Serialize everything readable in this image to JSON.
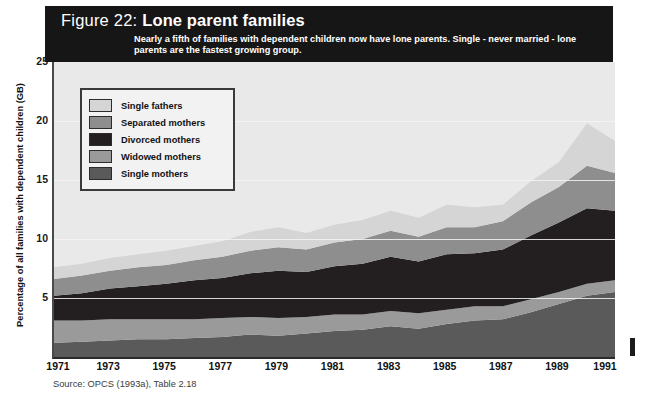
{
  "figure": {
    "number": "Figure 22:",
    "name": "Lone parent families",
    "subtitle": "Nearly a fifth of families with dependent children now have lone parents. Single - never married - lone parents are the fastest growing group.",
    "source": "Source: OPCS (1993a), Table 2.18"
  },
  "colors": {
    "header_band": "#161616",
    "plot_background": "#e9e9e9",
    "single_fathers": "#d5d5d5",
    "separated_mothers": "#8e8e8e",
    "divorced_mothers": "#231f20",
    "widowed_mothers": "#9a9a9a",
    "single_mothers": "#5a5a5a"
  },
  "legend": {
    "items": [
      {
        "label": "Single fathers",
        "color": "#d5d5d5"
      },
      {
        "label": "Separated mothers",
        "color": "#8e8e8e"
      },
      {
        "label": "Divorced mothers",
        "color": "#231f20"
      },
      {
        "label": "Widowed mothers",
        "color": "#9a9a9a"
      },
      {
        "label": "Single mothers",
        "color": "#5a5a5a"
      }
    ]
  },
  "chart_data": {
    "type": "area",
    "title": "Lone parent families",
    "subtitle": "Nearly a fifth of families with dependent children now have lone parents. Single - never married - lone parents are the fastest growing group.",
    "xlabel": "",
    "ylabel": "Percentage of all families with dependent children (GB)",
    "ylim": [
      0,
      25
    ],
    "yticks": [
      5,
      10,
      15,
      20,
      25
    ],
    "ytick_labels": [
      "5",
      "10",
      "15",
      "20",
      "25"
    ],
    "xlim": [
      1971,
      1991
    ],
    "xticks": [
      1971,
      1973,
      1975,
      1977,
      1979,
      1981,
      1983,
      1985,
      1987,
      1989,
      1991
    ],
    "xtick_labels": [
      "1971",
      "1973",
      "1975",
      "1977",
      "1979",
      "1981",
      "1983",
      "1985",
      "1987",
      "1989",
      "1991"
    ],
    "grid": true,
    "legend_position": "upper-left-inside",
    "stacked": true,
    "stack_order_bottom_to_top": [
      "Single mothers",
      "Widowed mothers",
      "Divorced mothers",
      "Separated mothers",
      "Single fathers"
    ],
    "x": [
      1971,
      1972,
      1973,
      1974,
      1975,
      1976,
      1977,
      1978,
      1979,
      1980,
      1981,
      1982,
      1983,
      1984,
      1985,
      1986,
      1987,
      1988,
      1989,
      1990,
      1991
    ],
    "series": [
      {
        "name": "Single mothers",
        "color": "#5a5a5a",
        "values": [
          1.2,
          1.3,
          1.4,
          1.5,
          1.5,
          1.6,
          1.7,
          1.9,
          1.8,
          2.0,
          2.2,
          2.3,
          2.6,
          2.4,
          2.8,
          3.1,
          3.2,
          3.8,
          4.5,
          5.2,
          5.5
        ]
      },
      {
        "name": "Widowed mothers",
        "color": "#9a9a9a",
        "values": [
          1.9,
          1.8,
          1.8,
          1.7,
          1.7,
          1.6,
          1.6,
          1.5,
          1.5,
          1.4,
          1.4,
          1.3,
          1.3,
          1.3,
          1.2,
          1.2,
          1.1,
          1.1,
          1.0,
          1.0,
          1.0
        ]
      },
      {
        "name": "Divorced mothers",
        "color": "#231f20",
        "values": [
          2.1,
          2.3,
          2.6,
          2.8,
          3.0,
          3.3,
          3.4,
          3.7,
          4.0,
          3.8,
          4.1,
          4.3,
          4.6,
          4.4,
          4.7,
          4.5,
          4.8,
          5.4,
          5.9,
          6.4,
          5.9
        ]
      },
      {
        "name": "Separated mothers",
        "color": "#8e8e8e",
        "values": [
          1.4,
          1.5,
          1.5,
          1.6,
          1.6,
          1.7,
          1.8,
          1.9,
          2.0,
          1.9,
          2.0,
          2.1,
          2.2,
          2.1,
          2.3,
          2.2,
          2.4,
          2.8,
          3.0,
          3.6,
          3.2
        ]
      },
      {
        "name": "Single fathers",
        "color": "#d5d5d5",
        "values": [
          1.0,
          1.0,
          1.1,
          1.1,
          1.2,
          1.2,
          1.3,
          1.6,
          1.7,
          1.4,
          1.5,
          1.6,
          1.7,
          1.6,
          1.9,
          1.7,
          1.4,
          1.8,
          2.1,
          3.6,
          2.7
        ]
      }
    ],
    "totals": [
      7.6,
      7.9,
      8.4,
      8.7,
      9.0,
      9.4,
      9.8,
      10.6,
      11.0,
      10.5,
      11.2,
      11.6,
      12.4,
      11.8,
      12.9,
      12.7,
      12.9,
      14.9,
      16.5,
      19.8,
      18.3
    ]
  }
}
